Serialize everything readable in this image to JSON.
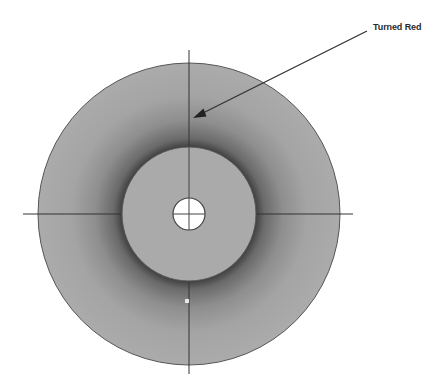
{
  "diagram": {
    "title": "",
    "annotation": {
      "label": "Turned Red",
      "arrow_icon": "arrow-icon",
      "from": [
        367,
        31
      ],
      "to": [
        193,
        118
      ]
    },
    "outer_disc": {
      "center": [
        189,
        214
      ],
      "radius": 151,
      "fill": "#a9a9a9",
      "shadow_color": "#5a5a5a",
      "stroke": "#555555"
    },
    "inner_disc": {
      "center": [
        189,
        214
      ],
      "radius": 67,
      "fill": "#aaaaaa",
      "stroke": "#555555"
    },
    "center_hole": {
      "center": [
        189,
        214
      ],
      "radius": 16,
      "fill": "#ffffff",
      "stroke": "#444444"
    },
    "crosshair": {
      "horizontal": {
        "x1": 23,
        "x2": 353,
        "y": 214
      },
      "vertical": {
        "x": 189,
        "y1": 50,
        "y2": 374
      },
      "color": "#333333"
    },
    "marker": {
      "position": [
        187,
        301
      ],
      "size": 4,
      "fill": "#e6e6e6"
    }
  }
}
